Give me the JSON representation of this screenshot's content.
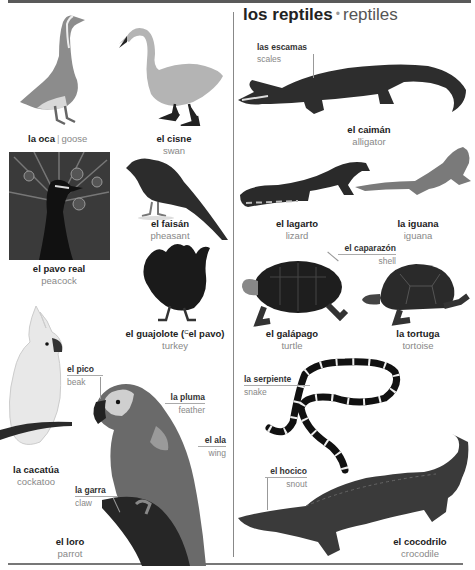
{
  "section": {
    "title_es": "los reptiles",
    "separator": "•",
    "title_en": "reptiles"
  },
  "birds": [
    {
      "es": "la oca",
      "en": "goose",
      "image": "goose-image"
    },
    {
      "es": "el cisne",
      "en": "swan",
      "image": "swan-image"
    },
    {
      "es": "el pavo real",
      "en": "peacock",
      "image": "peacock-image"
    },
    {
      "es": "el faisán",
      "en": "pheasant",
      "image": "pheasant-image"
    },
    {
      "es": "el guajolote (",
      "sup": "C",
      "es_alt": "el pavo)",
      "en": "turkey",
      "image": "turkey-image"
    },
    {
      "es": "la cacatúa",
      "en": "cockatoo",
      "image": "cockatoo-image"
    },
    {
      "es": "el loro",
      "en": "parrot",
      "image": "parrot-image"
    }
  ],
  "bird_parts": [
    {
      "es": "el pico",
      "en": "beak"
    },
    {
      "es": "la pluma",
      "en": "feather"
    },
    {
      "es": "el ala",
      "en": "wing"
    },
    {
      "es": "la garra",
      "en": "claw"
    }
  ],
  "reptiles": [
    {
      "es": "el caimán",
      "en": "alligator",
      "image": "alligator-image"
    },
    {
      "es": "el lagarto",
      "en": "lizard",
      "image": "lizard-image"
    },
    {
      "es": "la iguana",
      "en": "iguana",
      "image": "iguana-image"
    },
    {
      "es": "el galápago",
      "en": "turtle",
      "image": "turtle-image"
    },
    {
      "es": "la tortuga",
      "en": "tortoise",
      "image": "tortoise-image"
    },
    {
      "es": "el cocodrilo",
      "en": "crocodile",
      "image": "crocodile-image"
    }
  ],
  "reptile_parts": [
    {
      "es": "las escamas",
      "en": "scales"
    },
    {
      "es": "el caparazón",
      "en": "shell"
    },
    {
      "es": "la serpiente",
      "en": "snake"
    },
    {
      "es": "el hocico",
      "en": "snout"
    }
  ],
  "colors": {
    "rule": "#5a5a5a",
    "spanish_text": "#222222",
    "english_text": "#888888"
  }
}
